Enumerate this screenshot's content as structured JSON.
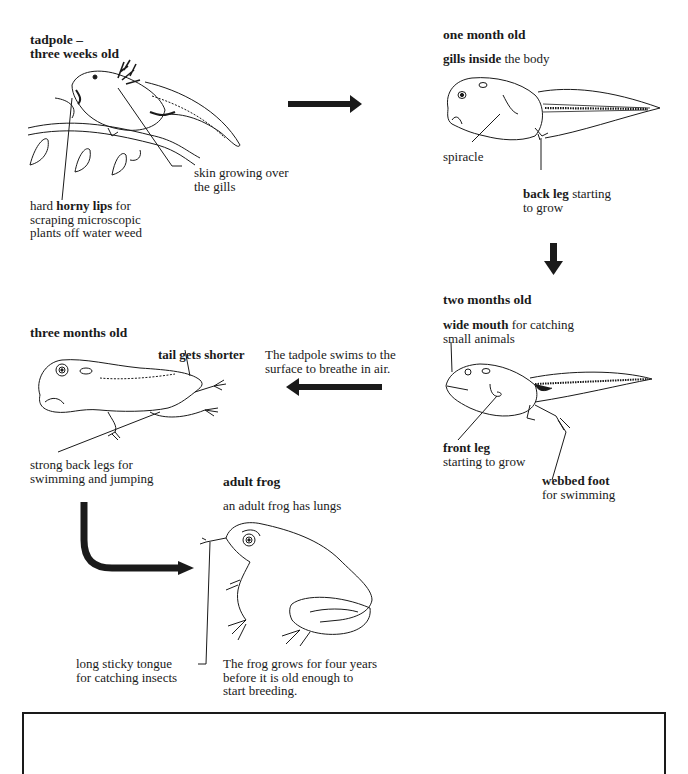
{
  "stages": {
    "tadpole_3w": {
      "title_line1": "tadpole –",
      "title_line2": "three weeks old",
      "label_skin_line1": "skin growing over",
      "label_skin_line2": "the gills",
      "label_lips_pre": "hard ",
      "label_lips_bold": "horny lips",
      "label_lips_post": " for",
      "label_lips_line2": "scraping microscopic",
      "label_lips_line3": "plants off water weed"
    },
    "one_month": {
      "title": "one month old",
      "gills_bold": "gills inside",
      "gills_rest": " the body",
      "label_spiracle": "spiracle",
      "backleg_bold": "back leg",
      "backleg_rest": " starting",
      "backleg_line2": "to grow"
    },
    "two_months": {
      "title": "two months old",
      "mouth_bold": "wide mouth",
      "mouth_rest": " for catching",
      "mouth_line2": "small animals",
      "frontleg_bold": "front leg",
      "frontleg_line2": "starting to grow",
      "foot_bold": "webbed foot",
      "foot_line2": "for swimming"
    },
    "three_months": {
      "title": "three months old",
      "tail_label": "tail gets shorter",
      "legs_line1": "strong back legs for",
      "legs_line2": "swimming and jumping"
    },
    "adult": {
      "title": "adult frog",
      "lungs": "an adult frog has lungs",
      "tongue_line1": "long sticky tongue",
      "tongue_line2": "for catching insects",
      "grow_line1": "The frog grows for four years",
      "grow_line2": "before it is old enough to",
      "grow_line3": "start breeding."
    }
  },
  "transition_note": {
    "line1": "The tadpole swims to the",
    "line2": "surface to breathe in air."
  },
  "arrows": [
    {
      "from": "tadpole_3w",
      "to": "one_month",
      "direction": "right"
    },
    {
      "from": "one_month",
      "to": "two_months",
      "direction": "down"
    },
    {
      "from": "two_months",
      "to": "three_months",
      "direction": "left"
    },
    {
      "from": "three_months",
      "to": "adult",
      "direction": "down-then-right"
    }
  ],
  "colors": {
    "ink": "#1a1a1a",
    "background": "#ffffff"
  }
}
